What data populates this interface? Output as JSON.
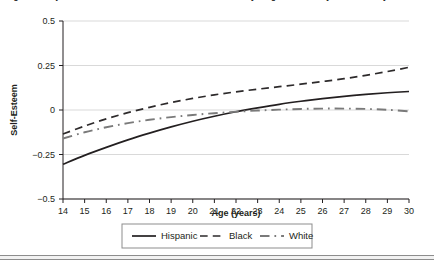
{
  "figure": {
    "caption_clipped": "Figure 2. Trajectories of self-esteem across adolescence and young adulthood by race/ethnicity",
    "bottom_rule": "figure-divider"
  },
  "chart_data": {
    "type": "line",
    "title": "",
    "xlabel": "Age (years)",
    "ylabel": "Self-Esteem",
    "x": [
      14,
      15,
      16,
      17,
      18,
      19,
      20,
      21,
      22,
      23,
      24,
      25,
      26,
      27,
      28,
      29,
      30
    ],
    "xlim": [
      14,
      30
    ],
    "ylim": [
      -0.5,
      0.5
    ],
    "yticks": [
      0.5,
      0.25,
      0,
      -0.25,
      -0.5
    ],
    "ytick_labels": [
      "0.5",
      "0.25",
      "0",
      "−0.25",
      "−0.5"
    ],
    "xticks": [
      14,
      15,
      16,
      17,
      18,
      19,
      20,
      21,
      22,
      23,
      24,
      25,
      26,
      27,
      28,
      29,
      30
    ],
    "xtick_labels": [
      "14",
      "15",
      "16",
      "17",
      "18",
      "19",
      "20",
      "21",
      "22",
      "23",
      "24",
      "25",
      "26",
      "27",
      "28",
      "29",
      "30"
    ],
    "grid": "horizontal",
    "legend_position": "bottom",
    "series": [
      {
        "name": "Hispanic",
        "style": "solid",
        "color": "#231f20",
        "values": [
          -0.305,
          -0.255,
          -0.21,
          -0.168,
          -0.13,
          -0.095,
          -0.063,
          -0.035,
          -0.01,
          0.012,
          0.032,
          0.049,
          0.064,
          0.077,
          0.088,
          0.097,
          0.104
        ]
      },
      {
        "name": "Black",
        "style": "dashed",
        "color": "#2d2a2b",
        "values": [
          -0.135,
          -0.09,
          -0.05,
          -0.015,
          0.015,
          0.042,
          0.065,
          0.085,
          0.102,
          0.117,
          0.131,
          0.145,
          0.16,
          0.176,
          0.195,
          0.216,
          0.24
        ]
      },
      {
        "name": "White",
        "style": "dashdot",
        "color": "#7a7a7a",
        "values": [
          -0.16,
          -0.125,
          -0.097,
          -0.074,
          -0.055,
          -0.04,
          -0.028,
          -0.018,
          -0.01,
          -0.003,
          0.002,
          0.006,
          0.008,
          0.008,
          0.006,
          0.001,
          -0.008
        ]
      }
    ]
  },
  "legend": {
    "items": [
      {
        "label": "Hispanic",
        "style": "solid"
      },
      {
        "label": "Black",
        "style": "dashed"
      },
      {
        "label": "White",
        "style": "dashdot"
      }
    ]
  },
  "colors": {
    "axis": "#231f20",
    "grid": "#d9d9d9",
    "background": "#ffffff",
    "legend_border": "#8d8d8d"
  }
}
